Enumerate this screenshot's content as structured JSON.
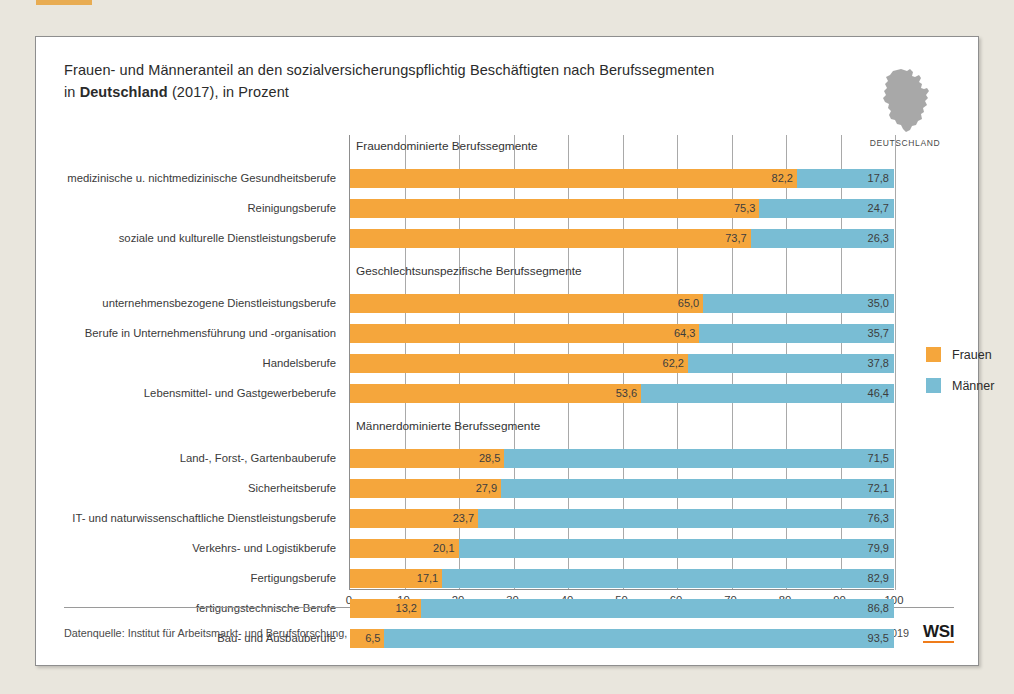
{
  "header": {
    "title_line1": "Frauen- und Männeranteil an den sozialversicherungspflichtig Beschäftigten nach Berufssegmenten",
    "title_line2_prefix": "in ",
    "title_line2_bold": "Deutschland",
    "title_line2_suffix": " (2017), in Prozent",
    "region_label": "DEUTSCHLAND",
    "region_icon": "germany-map-icon"
  },
  "legend": {
    "items": [
      {
        "label": "Frauen",
        "color": "#f5a63c"
      },
      {
        "label": "Männer",
        "color": "#79bdd4"
      }
    ]
  },
  "footer": {
    "source": "Datenquelle: Institut für Arbeitsmarkt- und Berufsforschung, Berufe im Spiegel der Statistik",
    "editor": "Bearbeitung: WSI GenderDatenPortal 2019",
    "logo": "WSI"
  },
  "chart_data": {
    "type": "bar",
    "orientation": "horizontal",
    "stacked": true,
    "title": "Frauen- und Männeranteil an den sozialversicherungspflichtig Beschäftigten nach Berufssegmenten in Deutschland (2017), in Prozent",
    "xlabel": "",
    "ylabel": "",
    "xlim": [
      0,
      100
    ],
    "xticks": [
      0,
      10,
      20,
      30,
      40,
      50,
      60,
      70,
      80,
      90,
      100
    ],
    "xtick_labels": [
      "0",
      "10",
      "20",
      "30",
      "40",
      "50",
      "60",
      "70",
      "80",
      "90",
      "100"
    ],
    "grid": true,
    "legend_position": "right",
    "series": [
      {
        "name": "Frauen",
        "color": "#f5a63c"
      },
      {
        "name": "Männer",
        "color": "#79bdd4"
      }
    ],
    "groups": [
      {
        "header": "Frauendominierte Berufssegmente",
        "rows": [
          {
            "category": "medizinische u. nichtmedizinische Gesundheitsberufe",
            "frauen": 82.2,
            "maenner": 17.8,
            "frauen_label": "82,2",
            "maenner_label": "17,8"
          },
          {
            "category": "Reinigungsberufe",
            "frauen": 75.3,
            "maenner": 24.7,
            "frauen_label": "75,3",
            "maenner_label": "24,7"
          },
          {
            "category": "soziale und kulturelle Dienstleistungsberufe",
            "frauen": 73.7,
            "maenner": 26.3,
            "frauen_label": "73,7",
            "maenner_label": "26,3"
          }
        ]
      },
      {
        "header": "Geschlechtsunspezifische Berufssegmente",
        "rows": [
          {
            "category": "unternehmensbezogene Dienstleistungsberufe",
            "frauen": 65.0,
            "maenner": 35.0,
            "frauen_label": "65,0",
            "maenner_label": "35,0"
          },
          {
            "category": "Berufe in Unternehmensführung und -organisation",
            "frauen": 64.3,
            "maenner": 35.7,
            "frauen_label": "64,3",
            "maenner_label": "35,7"
          },
          {
            "category": "Handelsberufe",
            "frauen": 62.2,
            "maenner": 37.8,
            "frauen_label": "62,2",
            "maenner_label": "37,8"
          },
          {
            "category": "Lebensmittel- und Gastgewerbeberufe",
            "frauen": 53.6,
            "maenner": 46.4,
            "frauen_label": "53,6",
            "maenner_label": "46,4"
          }
        ]
      },
      {
        "header": "Männerdominierte Berufssegmente",
        "rows": [
          {
            "category": "Land-, Forst-, Gartenbauberufe",
            "frauen": 28.5,
            "maenner": 71.5,
            "frauen_label": "28,5",
            "maenner_label": "71,5"
          },
          {
            "category": "Sicherheitsberufe",
            "frauen": 27.9,
            "maenner": 72.1,
            "frauen_label": "27,9",
            "maenner_label": "72,1"
          },
          {
            "category": "IT- und naturwissenschaftliche Dienstleistungsberufe",
            "frauen": 23.7,
            "maenner": 76.3,
            "frauen_label": "23,7",
            "maenner_label": "76,3"
          },
          {
            "category": "Verkehrs- und Logistikberufe",
            "frauen": 20.1,
            "maenner": 79.9,
            "frauen_label": "20,1",
            "maenner_label": "79,9"
          },
          {
            "category": "Fertigungsberufe",
            "frauen": 17.1,
            "maenner": 82.9,
            "frauen_label": "17,1",
            "maenner_label": "82,9"
          },
          {
            "category": "fertigungstechnische Berufe",
            "frauen": 13.2,
            "maenner": 86.8,
            "frauen_label": "13,2",
            "maenner_label": "86,8"
          },
          {
            "category": "Bau- und Ausbauberufe",
            "frauen": 6.5,
            "maenner": 93.5,
            "frauen_label": "6,5",
            "maenner_label": "93,5"
          }
        ]
      }
    ]
  }
}
